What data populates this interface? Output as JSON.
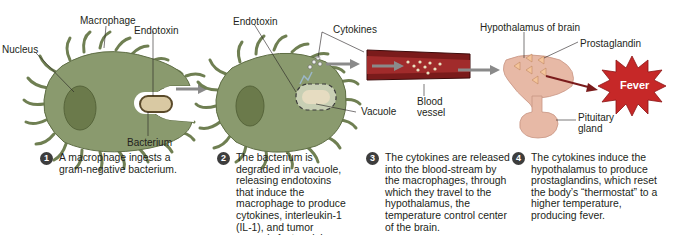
{
  "diagram": {
    "colors": {
      "macrophage_fill": "#8a9a6e",
      "macrophage_stroke": "#5f6e45",
      "nucleus": "#6b7a4b",
      "bacterium": "#d9c9a3",
      "vessel": "#7a1b1b",
      "fever_fill": "#c62828",
      "hypothalamus": "#e7b9a6",
      "prostaglandin": "#f4c49a",
      "arrow": "#8a8a8a",
      "badge": "#3d3d3d"
    },
    "panel1": {
      "labels": {
        "nucleus": "Nucleus",
        "macrophage": "Macrophage",
        "endotoxin": "Endotoxin",
        "bacterium": "Bacterium"
      }
    },
    "panel2": {
      "labels": {
        "endotoxin": "Endotoxin",
        "cytokines": "Cytokines",
        "vacuole": "Vacuole",
        "blood_vessel": "Blood vessel"
      }
    },
    "panel3": {
      "labels": {
        "hypothalamus": "Hypothalamus of brain",
        "prostaglandin": "Prostaglandin",
        "pituitary": "Pituitary gland",
        "fever": "Fever"
      }
    },
    "steps": [
      {
        "number": "1",
        "text": "A macrophage ingests a gram-negative bacterium."
      },
      {
        "number": "2",
        "text": "The bacterium is degraded in a vacuole, releasing endotoxins that induce the macrophage to produce cytokines, interleukin-1 (IL-1), and tumor necrosis factor alpha (TNF-α)."
      },
      {
        "number": "3",
        "text": "The cytokines are released into the blood-stream by the macrophages, through which they travel to the hypothalamus, the temperature control center of the brain."
      },
      {
        "number": "4",
        "text": "The cytokines induce the hypothalamus to produce prostaglandins, which reset the body’s “thermostat” to a higher temperature, producing fever."
      }
    ]
  }
}
